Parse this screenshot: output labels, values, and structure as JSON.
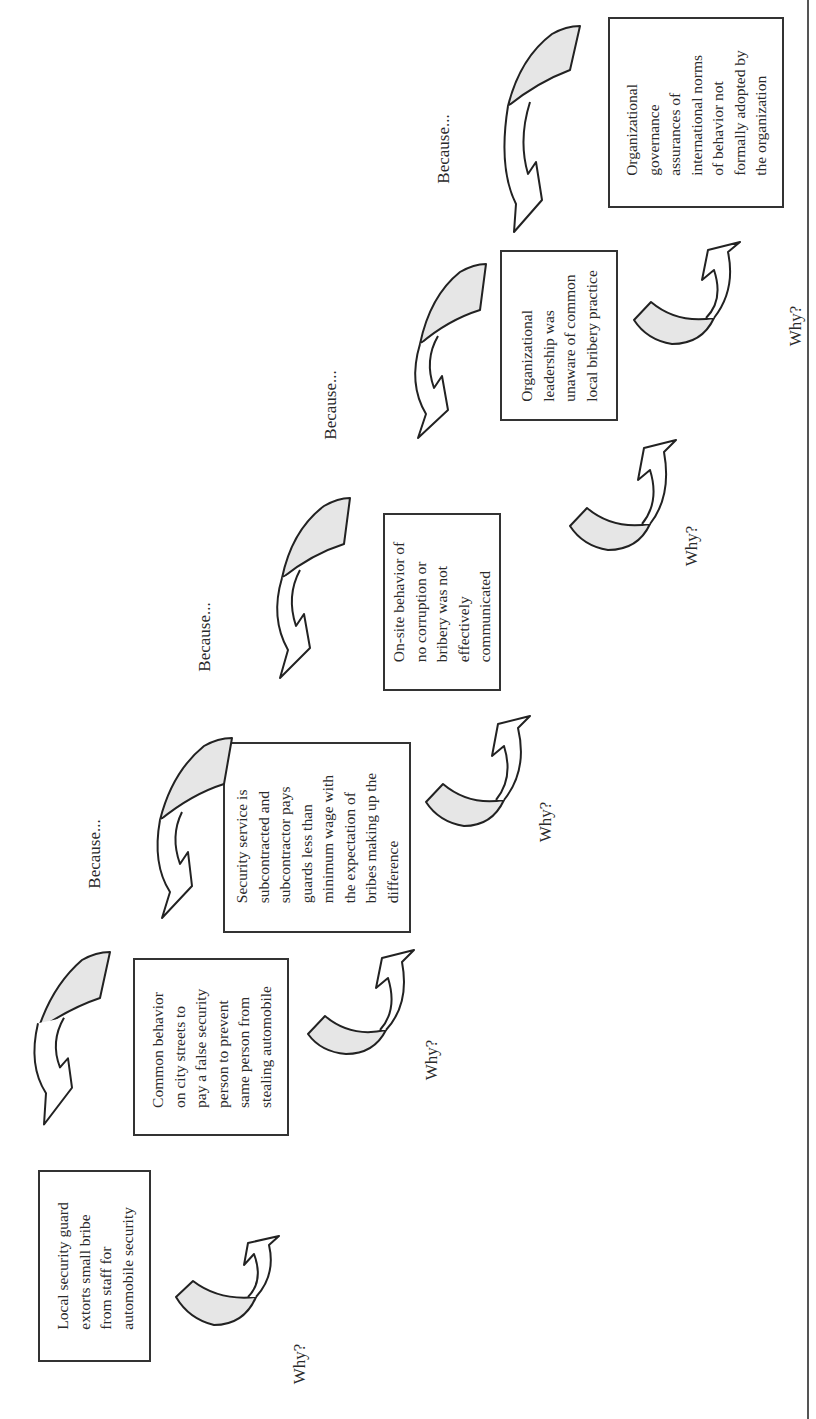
{
  "diagram": {
    "type": "five-whys-root-cause-chain",
    "orientation": "rotated-90-ccw",
    "colors": {
      "arrow_fill": "#e6e6e6",
      "stroke": "#222222",
      "box_border": "#333333"
    },
    "boxes": [
      {
        "id": "problem",
        "text": "Local security guard\nextorts small bribe\nfrom staff for\nautomobile security"
      },
      {
        "id": "why1",
        "text": "Common behavior\non city streets to\npay a false security\nperson to prevent\nsame person from\nstealing automobile"
      },
      {
        "id": "why2",
        "text": "Security service is\nsubcontracted and\nsubcontractor pays\nguards less than\nminimum wage with\nthe expectation of\nbribes making up the\ndifference"
      },
      {
        "id": "why3",
        "text": "On-site behavior of\nno corruption or\nbribery was not\neffectively\ncommunicated"
      },
      {
        "id": "why4",
        "text": "Organizational\nleadership was\nunaware of common\nlocal bribery practice"
      },
      {
        "id": "root",
        "text": "Organizational\ngovernance\nassurances of\ninternational norms\nof behavior not\nformally adopted by\nthe organization"
      }
    ],
    "why_labels": [
      "Why?",
      "Why?",
      "Why?",
      "Why?",
      "Why?"
    ],
    "because_labels": [
      "Because...",
      "Because...",
      "Because...",
      "Because...",
      "Because..."
    ]
  }
}
